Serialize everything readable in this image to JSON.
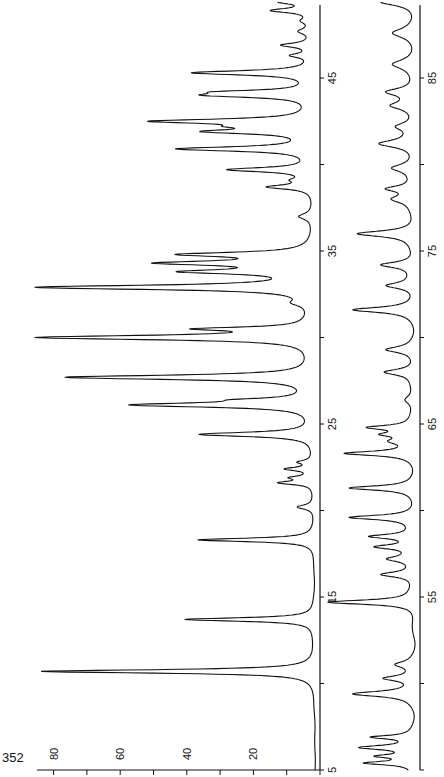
{
  "page_number": "352",
  "chart_data": {
    "type": "line",
    "title": "",
    "orientation": "rotated-90-ccw",
    "xlabel": "",
    "ylabel": "",
    "panels": [
      {
        "name": "upper-range",
        "x_range": [
          5,
          50
        ],
        "ylim": [
          0,
          85
        ],
        "x_tick_labels": [
          "5",
          "15",
          "25",
          "35",
          "45"
        ],
        "x_ticks": [
          5,
          10,
          15,
          20,
          25,
          30,
          35,
          40,
          45,
          50
        ],
        "y_tick_labels": [
          "20",
          "40",
          "60",
          "80"
        ],
        "y_ticks": [
          0,
          10,
          20,
          30,
          40,
          50,
          60,
          70,
          80
        ],
        "peaks": [
          {
            "x": 10.7,
            "y": 82,
            "w": 0.12
          },
          {
            "x": 13.7,
            "y": 39,
            "w": 0.12
          },
          {
            "x": 18.3,
            "y": 35,
            "w": 0.12
          },
          {
            "x": 20.2,
            "y": 5,
            "w": 0.15
          },
          {
            "x": 21.6,
            "y": 10,
            "w": 0.12
          },
          {
            "x": 21.9,
            "y": 6,
            "w": 0.12
          },
          {
            "x": 22.4,
            "y": 8,
            "w": 0.12
          },
          {
            "x": 22.8,
            "y": 4,
            "w": 0.12
          },
          {
            "x": 24.4,
            "y": 34,
            "w": 0.15
          },
          {
            "x": 26.1,
            "y": 53,
            "w": 0.15
          },
          {
            "x": 26.4,
            "y": 14,
            "w": 0.12
          },
          {
            "x": 27.7,
            "y": 74,
            "w": 0.15
          },
          {
            "x": 30.0,
            "y": 82,
            "w": 0.15
          },
          {
            "x": 30.5,
            "y": 30,
            "w": 0.12
          },
          {
            "x": 32.0,
            "y": 4,
            "w": 0.2
          },
          {
            "x": 32.9,
            "y": 82,
            "w": 0.15
          },
          {
            "x": 33.8,
            "y": 35,
            "w": 0.15
          },
          {
            "x": 34.3,
            "y": 42,
            "w": 0.15
          },
          {
            "x": 34.8,
            "y": 37,
            "w": 0.15
          },
          {
            "x": 37.0,
            "y": 4,
            "w": 0.2
          },
          {
            "x": 38.7,
            "y": 13,
            "w": 0.15
          },
          {
            "x": 39.1,
            "y": 4,
            "w": 0.15
          },
          {
            "x": 39.7,
            "y": 25,
            "w": 0.15
          },
          {
            "x": 40.9,
            "y": 40,
            "w": 0.15
          },
          {
            "x": 41.9,
            "y": 29,
            "w": 0.15
          },
          {
            "x": 42.2,
            "y": 12,
            "w": 0.12
          },
          {
            "x": 42.5,
            "y": 46,
            "w": 0.15
          },
          {
            "x": 44.0,
            "y": 28,
            "w": 0.15
          },
          {
            "x": 44.2,
            "y": 20,
            "w": 0.12
          },
          {
            "x": 45.3,
            "y": 36,
            "w": 0.15
          },
          {
            "x": 46.3,
            "y": 6,
            "w": 0.15
          },
          {
            "x": 46.9,
            "y": 9,
            "w": 0.15
          },
          {
            "x": 47.7,
            "y": 4,
            "w": 0.2
          },
          {
            "x": 48.3,
            "y": 3,
            "w": 0.2
          },
          {
            "x": 48.9,
            "y": 12,
            "w": 0.15
          },
          {
            "x": 49.4,
            "y": 10,
            "w": 0.15
          }
        ]
      },
      {
        "name": "lower-range",
        "x_range": [
          45,
          90
        ],
        "ylim": [
          0,
          85
        ],
        "x_tick_labels": [
          "55",
          "65",
          "75",
          "85"
        ],
        "x_ticks": [
          45,
          50,
          55,
          60,
          65,
          70,
          75,
          80,
          85,
          90
        ],
        "peaks": [
          {
            "x": 45.4,
            "y": 14,
            "w": 0.12
          },
          {
            "x": 45.8,
            "y": 10,
            "w": 0.12
          },
          {
            "x": 46.3,
            "y": 16,
            "w": 0.15
          },
          {
            "x": 46.9,
            "y": 12,
            "w": 0.12
          },
          {
            "x": 49.4,
            "y": 18,
            "w": 0.18
          },
          {
            "x": 50.3,
            "y": 9,
            "w": 0.18
          },
          {
            "x": 51.1,
            "y": 5,
            "w": 0.2
          },
          {
            "x": 54.7,
            "y": 26,
            "w": 0.15
          },
          {
            "x": 56.3,
            "y": 10,
            "w": 0.18
          },
          {
            "x": 57.2,
            "y": 7,
            "w": 0.18
          },
          {
            "x": 57.9,
            "y": 11,
            "w": 0.15
          },
          {
            "x": 58.5,
            "y": 13,
            "w": 0.15
          },
          {
            "x": 59.6,
            "y": 19,
            "w": 0.15
          },
          {
            "x": 61.3,
            "y": 19,
            "w": 0.15
          },
          {
            "x": 63.3,
            "y": 20,
            "w": 0.15
          },
          {
            "x": 64.0,
            "y": 6,
            "w": 0.2
          },
          {
            "x": 64.4,
            "y": 8,
            "w": 0.15
          },
          {
            "x": 64.8,
            "y": 13,
            "w": 0.15
          },
          {
            "x": 66.4,
            "y": 3,
            "w": 0.3
          },
          {
            "x": 68.0,
            "y": 9,
            "w": 0.2
          },
          {
            "x": 69.3,
            "y": 8,
            "w": 0.2
          },
          {
            "x": 71.6,
            "y": 18,
            "w": 0.18
          },
          {
            "x": 73.0,
            "y": 8,
            "w": 0.2
          },
          {
            "x": 74.2,
            "y": 10,
            "w": 0.2
          },
          {
            "x": 76.0,
            "y": 17,
            "w": 0.2
          },
          {
            "x": 78.0,
            "y": 6,
            "w": 0.25
          },
          {
            "x": 78.6,
            "y": 8,
            "w": 0.2
          },
          {
            "x": 79.8,
            "y": 6,
            "w": 0.25
          },
          {
            "x": 81.2,
            "y": 10,
            "w": 0.25
          },
          {
            "x": 82.2,
            "y": 5,
            "w": 0.25
          },
          {
            "x": 83.4,
            "y": 6,
            "w": 0.25
          },
          {
            "x": 84.2,
            "y": 8,
            "w": 0.25
          },
          {
            "x": 85.8,
            "y": 6,
            "w": 0.3
          },
          {
            "x": 87.6,
            "y": 6,
            "w": 0.3
          },
          {
            "x": 89.4,
            "y": 10,
            "w": 0.25
          }
        ]
      }
    ]
  }
}
